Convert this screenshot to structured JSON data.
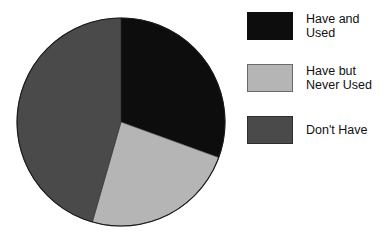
{
  "chart_data": {
    "type": "pie",
    "title": "",
    "categories": [
      "Have and Used",
      "Have but Never Used",
      "Don't Have"
    ],
    "values": [
      30.5,
      24.0,
      45.5
    ],
    "units": "percent",
    "start_angle_deg": 0,
    "direction": "clockwise",
    "legend_position": "right",
    "grid": false,
    "slices": [
      {
        "label": "Have and Used",
        "label_lines": "Have and\nUsed",
        "value": 30.5,
        "color": "#0d0d0d",
        "start_angle_deg": 0,
        "end_angle_deg": 110
      },
      {
        "label": "Have but Never Used",
        "label_lines": "Have but\nNever Used",
        "value": 24.0,
        "color": "#b5b5b5",
        "start_angle_deg": 110,
        "end_angle_deg": 196
      },
      {
        "label": "Don't Have",
        "label_lines": "Don't Have",
        "value": 45.5,
        "color": "#4a4a4a",
        "start_angle_deg": 196,
        "end_angle_deg": 360
      }
    ]
  },
  "pie": {
    "center_x": 105,
    "center_y": 105,
    "radius": 104,
    "outline_color": "#000000"
  },
  "legend": {
    "items": [
      {
        "label": "Have and\nUsed",
        "color": "#0d0d0d",
        "border": "#0d0d0d"
      },
      {
        "label": "Have but\nNever Used",
        "color": "#b5b5b5",
        "border": "#6a6a6a"
      },
      {
        "label": "Don't Have",
        "color": "#4a4a4a",
        "border": "#2e2e2e"
      }
    ]
  },
  "colors": {
    "background": "#ffffff",
    "text": "#111111",
    "slice_have_and_used": "#0d0d0d",
    "slice_have_but_never_used": "#b5b5b5",
    "slice_dont_have": "#4a4a4a"
  }
}
